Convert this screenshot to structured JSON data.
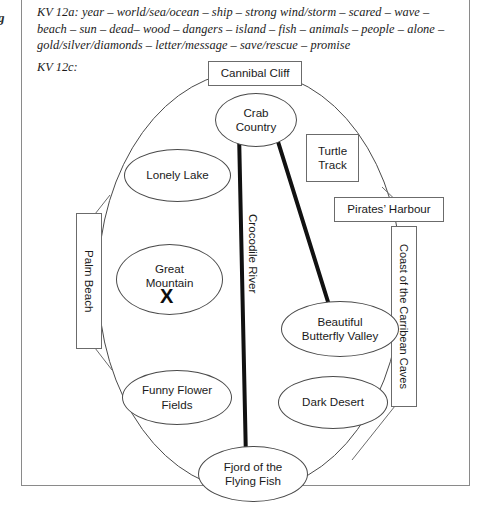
{
  "margin": {
    "glyph": "g"
  },
  "vocab": {
    "id": "KV 12a:",
    "text": "KV 12a: year – world/sea/ocean – ship – strong wind/storm – scared – wave – beach – sun – dead– wood – dangers – island – fish – animals – people – alone – gold/silver/diamonds – letter/message – save/rescue – promise"
  },
  "task": {
    "label": "KV 12c:"
  },
  "mindmap": {
    "title": "treasure island mind map",
    "island_outline": "large ellipse representing the island",
    "nodes": [
      {
        "id": "cannibal-cliff",
        "label": "Cannibal Cliff",
        "shape": "box"
      },
      {
        "id": "crab-country",
        "label": "Crab\nCountry",
        "shape": "ellipse"
      },
      {
        "id": "turtle-track",
        "label": "Turtle\nTrack",
        "shape": "box"
      },
      {
        "id": "lonely-lake",
        "label": "Lonely Lake",
        "shape": "ellipse"
      },
      {
        "id": "pirates-harbour",
        "label": "Pirates’ Harbour",
        "shape": "box"
      },
      {
        "id": "palm-beach",
        "label": "Palm Beach",
        "shape": "box-vertical"
      },
      {
        "id": "coast-caribbean-caves",
        "label": "Coast of the Carribean Caves",
        "shape": "box-vertical"
      },
      {
        "id": "great-mountain",
        "label": "Great\nMountain",
        "shape": "ellipse"
      },
      {
        "id": "crocodile-river",
        "label": "Crocodile River",
        "shape": "vertical-text"
      },
      {
        "id": "beautiful-butterfly-valley",
        "label": "Beautiful\nButterfly Valley",
        "shape": "ellipse"
      },
      {
        "id": "funny-flower-fields",
        "label": "Funny Flower\nFields",
        "shape": "ellipse"
      },
      {
        "id": "dark-desert",
        "label": "Dark Desert",
        "shape": "ellipse"
      },
      {
        "id": "fjord-flying-fish",
        "label": "Fjord of the\nFlying Fish",
        "shape": "ellipse"
      }
    ],
    "treasure_marker": "X",
    "colors": {
      "outline": "#4a4a4a",
      "box_border": "#6b6b6b",
      "river": "#111111",
      "frame": "#8a8a8a",
      "text": "#1a1a1a"
    }
  }
}
